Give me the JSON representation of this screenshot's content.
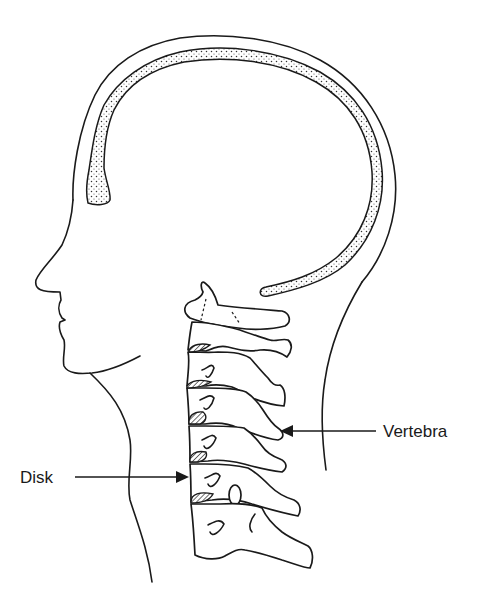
{
  "figure": {
    "colors": {
      "ink": "#1a1a1a",
      "background": "#ffffff"
    }
  },
  "labels": {
    "vertebra": "Vertebra",
    "disk": "Disk"
  },
  "components": {
    "head_outline": "head-outline",
    "dura_band": "dotted-brain-covering",
    "face_profile": "face-profile",
    "neck_front": "neck-front-line",
    "neck_back": "neck-back-line",
    "cervical_spine": {
      "vertebra_count": 7,
      "disk_count": 5
    }
  },
  "arrows": [
    {
      "label": "Vertebra",
      "direction": "left",
      "target": "vertebra"
    },
    {
      "label": "Disk",
      "direction": "right",
      "target": "disk"
    }
  ]
}
